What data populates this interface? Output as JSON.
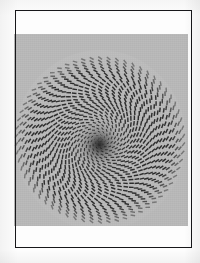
{
  "figure": {
    "caption": "",
    "frame_color": "#17171a",
    "page_background": "#fdfdfd",
    "plate_background": "#b9b9b9",
    "dash_color": "#242424",
    "frame": {
      "x": 15,
      "y": 10,
      "width": 177,
      "height": 238
    },
    "plate": {
      "x": 14,
      "y": 34,
      "width": 174,
      "height": 192
    }
  },
  "chart_data": {
    "type": "scatter",
    "subtitle": "",
    "xlabel": "",
    "ylabel": "",
    "grid": false,
    "legend_position": "none",
    "xlim": [
      0,
      174
    ],
    "ylim": [
      0,
      192
    ],
    "annotations": [],
    "tick_labels": {
      "x": [],
      "y": []
    },
    "pattern": {
      "kind": "concentric-ring-dash-spiral",
      "center_x": 86,
      "center_y": 106,
      "inner_radius": 2,
      "outer_radius": 84,
      "ring_count": 26,
      "ring_spacing": 3.2,
      "dash_length": 4.6,
      "dash_thickness": 1.45,
      "dash_color": "#242424",
      "angular_pitch_deg": 9.2,
      "spiral_twist_deg_per_ring": 11.5,
      "dash_tilt_deg": 34,
      "center_darkening_radius": 26,
      "ellipse_aspect": 1.02
    },
    "series": [
      {
        "name": "dash elements",
        "description": "Short dark dashes placed on concentric rings; each ring is rotated progressively and each dash is tilted relative to its radius, producing an apparent spiral vortex.",
        "ring_radii": [
          2,
          5.2,
          8.4,
          11.6,
          14.8,
          18,
          21.2,
          24.4,
          27.6,
          30.8,
          34,
          37.2,
          40.4,
          43.6,
          46.8,
          50,
          53.2,
          56.4,
          59.6,
          62.8,
          66,
          69.2,
          72.4,
          75.6,
          78.8,
          82
        ],
        "dashes_per_ring": [
          6,
          8,
          12,
          16,
          20,
          24,
          26,
          30,
          32,
          36,
          38,
          40,
          42,
          44,
          46,
          48,
          50,
          52,
          54,
          56,
          56,
          58,
          58,
          60,
          60,
          62
        ]
      }
    ]
  }
}
